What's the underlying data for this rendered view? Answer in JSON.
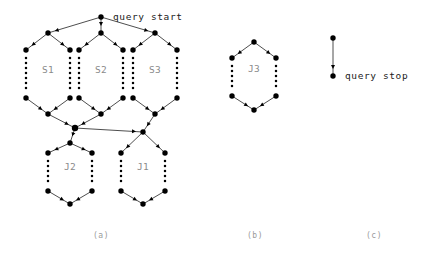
{
  "figure": {
    "width": 422,
    "height": 261,
    "background": "#ffffff",
    "node_color": "#000000",
    "edge_color": "#3a3a3a",
    "label_color": "#8a8a8a",
    "annotation_color": "#1a1a1a"
  },
  "annotations": {
    "query_start": "query start",
    "query_stop": "query stop"
  },
  "panels": [
    {
      "id": "a",
      "label": "(a)",
      "x": 101,
      "y": 238
    },
    {
      "id": "b",
      "label": "(b)",
      "x": 255,
      "y": 238
    },
    {
      "id": "c",
      "label": "(c)",
      "x": 374,
      "y": 238
    }
  ],
  "region_labels": [
    {
      "name": "S1",
      "text": "S1",
      "x": 48,
      "y": 73
    },
    {
      "name": "S2",
      "text": "S2",
      "x": 101,
      "y": 73
    },
    {
      "name": "S3",
      "text": "S3",
      "x": 155,
      "y": 73
    },
    {
      "name": "J2",
      "text": "J2",
      "x": 70,
      "y": 170
    },
    {
      "name": "J1",
      "text": "J1",
      "x": 143,
      "y": 170
    },
    {
      "name": "J3",
      "text": "J3",
      "x": 254,
      "y": 72
    }
  ],
  "nodes": {
    "start": {
      "x": 101,
      "y": 17
    },
    "s1_top": {
      "x": 48,
      "y": 33
    },
    "s1_left_t": {
      "x": 26,
      "y": 50
    },
    "s1_right_t": {
      "x": 70,
      "y": 50
    },
    "s1_left_b": {
      "x": 26,
      "y": 98
    },
    "s1_right_b": {
      "x": 70,
      "y": 98
    },
    "s1_bot": {
      "x": 48,
      "y": 114
    },
    "s2_top": {
      "x": 101,
      "y": 33
    },
    "s2_left_t": {
      "x": 79,
      "y": 50
    },
    "s2_right_t": {
      "x": 123,
      "y": 50
    },
    "s2_left_b": {
      "x": 79,
      "y": 98
    },
    "s2_right_b": {
      "x": 123,
      "y": 98
    },
    "s2_bot": {
      "x": 101,
      "y": 114
    },
    "s3_top": {
      "x": 155,
      "y": 33
    },
    "s3_left_t": {
      "x": 133,
      "y": 50
    },
    "s3_right_t": {
      "x": 177,
      "y": 50
    },
    "s3_left_b": {
      "x": 133,
      "y": 98
    },
    "s3_right_b": {
      "x": 177,
      "y": 98
    },
    "s3_bot": {
      "x": 155,
      "y": 114
    },
    "cross": {
      "x": 75,
      "y": 128
    },
    "j2_top": {
      "x": 70,
      "y": 143
    },
    "j2_left_t": {
      "x": 48,
      "y": 153
    },
    "j2_right_t": {
      "x": 92,
      "y": 153
    },
    "j2_left_b": {
      "x": 48,
      "y": 191
    },
    "j2_right_b": {
      "x": 92,
      "y": 191
    },
    "j2_bot": {
      "x": 70,
      "y": 204
    },
    "j1_top": {
      "x": 143,
      "y": 132
    },
    "j1_left_t": {
      "x": 121,
      "y": 153
    },
    "j1_right_t": {
      "x": 165,
      "y": 153
    },
    "j1_left_b": {
      "x": 121,
      "y": 191
    },
    "j1_right_b": {
      "x": 165,
      "y": 191
    },
    "j1_bot": {
      "x": 143,
      "y": 204
    },
    "j3_top": {
      "x": 254,
      "y": 42
    },
    "j3_left_t": {
      "x": 232,
      "y": 58
    },
    "j3_right_t": {
      "x": 276,
      "y": 58
    },
    "j3_left_b": {
      "x": 232,
      "y": 96
    },
    "j3_right_b": {
      "x": 276,
      "y": 96
    },
    "j3_bot": {
      "x": 254,
      "y": 110
    },
    "stop_top": {
      "x": 333,
      "y": 38
    },
    "stop_bot": {
      "x": 333,
      "y": 76
    }
  },
  "edges": [
    [
      "start",
      "s1_top"
    ],
    [
      "start",
      "s2_top"
    ],
    [
      "start",
      "s3_top"
    ],
    [
      "s1_top",
      "s1_left_t"
    ],
    [
      "s1_top",
      "s1_right_t"
    ],
    [
      "s1_left_b",
      "s1_bot"
    ],
    [
      "s1_right_b",
      "s1_bot"
    ],
    [
      "s2_top",
      "s2_left_t"
    ],
    [
      "s2_top",
      "s2_right_t"
    ],
    [
      "s2_left_b",
      "s2_bot"
    ],
    [
      "s2_right_b",
      "s2_bot"
    ],
    [
      "s3_top",
      "s3_left_t"
    ],
    [
      "s3_top",
      "s3_right_t"
    ],
    [
      "s3_left_b",
      "s3_bot"
    ],
    [
      "s3_right_b",
      "s3_bot"
    ],
    [
      "s1_bot",
      "cross"
    ],
    [
      "s2_bot",
      "cross"
    ],
    [
      "cross",
      "j2_top"
    ],
    [
      "cross",
      "j1_top"
    ],
    [
      "s3_bot",
      "j1_top"
    ],
    [
      "j2_top",
      "j2_left_t"
    ],
    [
      "j2_top",
      "j2_right_t"
    ],
    [
      "j2_left_b",
      "j2_bot"
    ],
    [
      "j2_right_b",
      "j2_bot"
    ],
    [
      "j1_top",
      "j1_left_t"
    ],
    [
      "j1_top",
      "j1_right_t"
    ],
    [
      "j1_left_b",
      "j1_bot"
    ],
    [
      "j1_right_b",
      "j1_bot"
    ],
    [
      "j3_top",
      "j3_left_t"
    ],
    [
      "j3_top",
      "j3_right_t"
    ],
    [
      "j3_left_b",
      "j3_bot"
    ],
    [
      "j3_right_b",
      "j3_bot"
    ],
    [
      "stop_top",
      "stop_bot"
    ]
  ],
  "dotted_columns": [
    {
      "x": 26,
      "y0": 58,
      "y1": 92
    },
    {
      "x": 70,
      "y0": 58,
      "y1": 92
    },
    {
      "x": 79,
      "y0": 58,
      "y1": 92
    },
    {
      "x": 123,
      "y0": 58,
      "y1": 92
    },
    {
      "x": 133,
      "y0": 58,
      "y1": 92
    },
    {
      "x": 177,
      "y0": 58,
      "y1": 92
    },
    {
      "x": 48,
      "y0": 161,
      "y1": 185
    },
    {
      "x": 92,
      "y0": 161,
      "y1": 185
    },
    {
      "x": 121,
      "y0": 161,
      "y1": 185
    },
    {
      "x": 165,
      "y0": 161,
      "y1": 185
    },
    {
      "x": 232,
      "y0": 66,
      "y1": 90
    },
    {
      "x": 276,
      "y0": 66,
      "y1": 90
    }
  ],
  "annotation_positions": {
    "query_start": {
      "x": 113,
      "y": 20
    },
    "query_stop": {
      "x": 345,
      "y": 79
    }
  }
}
